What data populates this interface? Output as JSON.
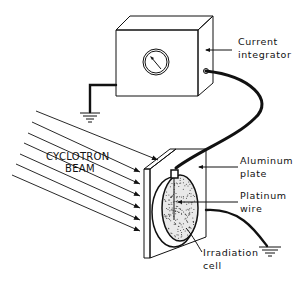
{
  "diagram": {
    "components": [
      {
        "id": "current-integrator",
        "label_lines": [
          "Current",
          "integrator"
        ]
      },
      {
        "id": "cyclotron-beam",
        "label_lines": [
          "CYCLOTRON",
          "BEAM"
        ]
      },
      {
        "id": "aluminum-plate",
        "label_lines": [
          "Aluminum",
          "plate"
        ]
      },
      {
        "id": "platinum-wire",
        "label_lines": [
          "Platinum",
          "wire"
        ]
      },
      {
        "id": "irradiation-cell",
        "label_lines": [
          "Irradiation",
          "cell"
        ]
      }
    ],
    "grounds": [
      "integrator-ground",
      "plate-ground"
    ],
    "beam_arrow_count": 7
  }
}
